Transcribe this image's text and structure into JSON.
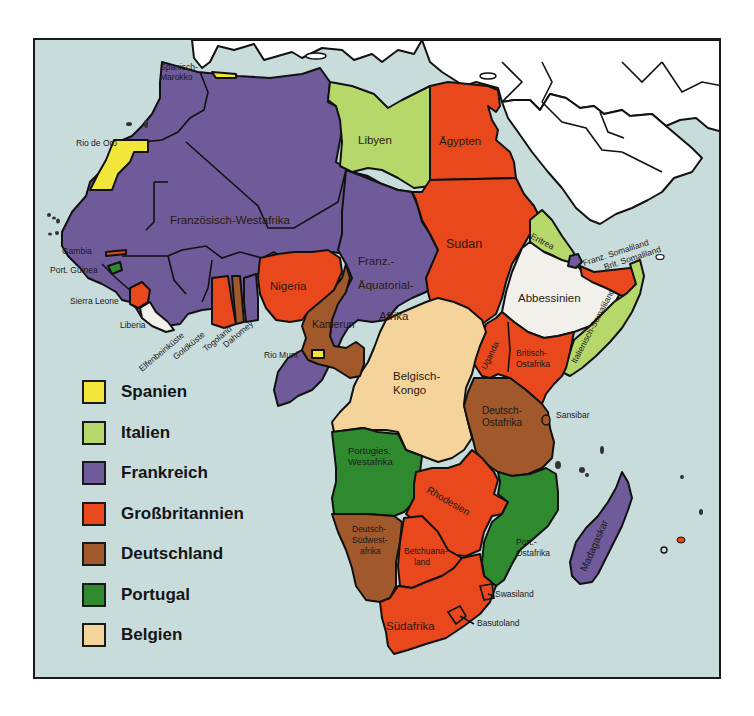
{
  "map": {
    "title": "Kolonialreiche in Afrika",
    "colors": {
      "sea": "#c9dcdc",
      "land_other": "#ffffff",
      "spanien": "#f2e63a",
      "italien": "#b6d86a",
      "frankreich": "#6f5b9a",
      "grossbritannien": "#e8481c",
      "deutschland": "#a1592b",
      "portugal": "#2f8a2f",
      "belgien": "#f4d49a",
      "independent": "#f2f0ea"
    },
    "labels": {
      "spanisch_marokko_1": "Spanisch-",
      "spanisch_marokko_2": "Marokko",
      "rio_de_oro": "Rio de Oro",
      "libyen": "Libyen",
      "aegypten": "Ägypten",
      "franz_westafrika": "Französisch-Westafrika",
      "sudan": "Sudan",
      "eritrea": "Eritrea",
      "franz_somaliland": "Franz. Somaliland",
      "brit_somaliland": "Brit. Somaliland",
      "abbessinien": "Abbessinien",
      "ital_somaliland": "Italienisch-Somaliland",
      "gambia": "Gambia",
      "port_guinea": "Port. Guinea",
      "sierra_leone": "Sierra Leone",
      "liberia": "Liberia",
      "elfenbeinkueste": "Elfenbeinküste",
      "goldkueste": "Goldküste",
      "togoland": "Togoland",
      "dahomey": "Dahomey",
      "nigeria": "Nigeria",
      "kamerun": "Kamerun",
      "rio_muni": "Rio Muni",
      "franz_aeq_1": "Franz.-",
      "franz_aeq_2": "Äquatorial-",
      "franz_aeq_3": "Afrika",
      "belg_kongo_1": "Belgisch-",
      "belg_kongo_2": "Kongo",
      "uganda": "Uganda",
      "brit_ostafrika_1": "Britisch-",
      "brit_ostafrika_2": "Ostafrika",
      "dt_ostafrika_1": "Deutsch-",
      "dt_ostafrika_2": "Ostafrika",
      "sansibar": "Sansibar",
      "port_westafrika_1": "Portugies.",
      "port_westafrika_2": "Westafrika",
      "rhodesien": "Rhodesien",
      "dt_suedwest_1": "Deutsch-",
      "dt_suedwest_2": "Südwest-",
      "dt_suedwest_3": "afrika",
      "betschuana_1": "Betchuana-",
      "betschuana_2": "land",
      "port_ostafrika_1": "Port.-",
      "port_ostafrika_2": "Ostafrika",
      "swasiland": "Swasiland",
      "basutoland": "Basutoland",
      "suedafrika": "Südafrika",
      "madagaskar": "Madagaskar"
    }
  },
  "legend": {
    "items": [
      {
        "label": "Spanien",
        "color": "#f2e63a"
      },
      {
        "label": "Italien",
        "color": "#b6d86a"
      },
      {
        "label": "Frankreich",
        "color": "#6f5b9a"
      },
      {
        "label": "Großbritannien",
        "color": "#e8481c"
      },
      {
        "label": "Deutschland",
        "color": "#a1592b"
      },
      {
        "label": "Portugal",
        "color": "#2f8a2f"
      },
      {
        "label": "Belgien",
        "color": "#f4d49a"
      }
    ]
  }
}
